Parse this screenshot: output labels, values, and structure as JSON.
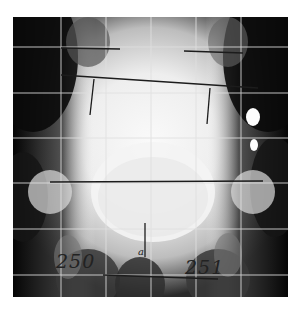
{
  "figure": {
    "type": "radiograph",
    "view": "AP pelvis",
    "annotations": {
      "left_number": "250",
      "right_number": "251",
      "center_mark": "a"
    },
    "grid": {
      "color": "#d8d8d8",
      "vertical_lines": 5,
      "horizontal_lines": 6
    },
    "drawn_lines": [
      {
        "name": "upper-left-horizontal"
      },
      {
        "name": "upper-right-horizontal"
      },
      {
        "name": "iliac-crest-oblique-line"
      },
      {
        "name": "left-vertical-tick"
      },
      {
        "name": "right-vertical-tick"
      },
      {
        "name": "acetabular-horizontal-line"
      },
      {
        "name": "symphysis-vertical-line"
      },
      {
        "name": "lower-horizontal-line"
      }
    ]
  }
}
